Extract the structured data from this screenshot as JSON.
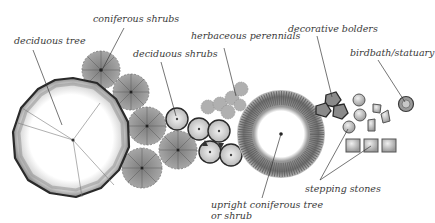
{
  "diagram": {
    "colors": {
      "background": "#ffffff",
      "outline": "#2a2a2a",
      "foliage": "#8a8a8a",
      "foliage_light": "#b5b5b5",
      "leader_line": "#3a3a3a",
      "label_text": "#3a3a3a"
    },
    "labels": {
      "deciduous_tree": "deciduous tree",
      "coniferous_shrubs": "coniferous shrubs",
      "deciduous_shrubs": "deciduous shrubs",
      "herbaceous_perennials": "herbaceous perennials",
      "decorative_bolders": "decorative bolders",
      "birdbath_statuary": "birdbath/statuary",
      "upright_coniferous_line1": "upright coniferous tree",
      "upright_coniferous_line2": "or shrub",
      "stepping_stones": "stepping stones"
    },
    "elements": [
      {
        "id": "deciduous-tree",
        "type": "large-tree-canopy",
        "cx": 73,
        "cy": 138,
        "r": 60
      },
      {
        "id": "coniferous-shrubs",
        "type": "shrub-cluster",
        "count": 6
      },
      {
        "id": "deciduous-shrubs",
        "type": "shrub-cluster",
        "count": 5
      },
      {
        "id": "herbaceous-perennials",
        "type": "perennial-mass",
        "count": 6
      },
      {
        "id": "upright-coniferous",
        "type": "ring-tree",
        "cx": 281,
        "cy": 134,
        "r": 44
      },
      {
        "id": "decorative-bolders",
        "type": "boulders",
        "count": 3
      },
      {
        "id": "stepping-stones",
        "type": "stones",
        "count": 9
      },
      {
        "id": "birdbath",
        "type": "birdbath",
        "cx": 406,
        "cy": 104,
        "r": 8
      }
    ]
  }
}
